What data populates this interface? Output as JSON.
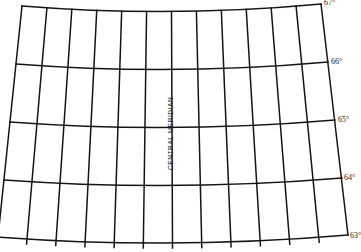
{
  "diagram": {
    "type": "map-projection-graticule",
    "central_meridian_label": "CENTRAL MERIDIAN",
    "line_color": "#151515",
    "background_color": "#ffffff",
    "parallels": [
      {
        "label": "67°",
        "lat": 67
      },
      {
        "label": "66°",
        "lat": 66
      },
      {
        "label": "65°",
        "lat": 65
      },
      {
        "label": "64°",
        "lat": 64
      },
      {
        "label": "63°",
        "lat": 63
      }
    ],
    "meridian_count": 13,
    "central_meridian_index": 6
  }
}
